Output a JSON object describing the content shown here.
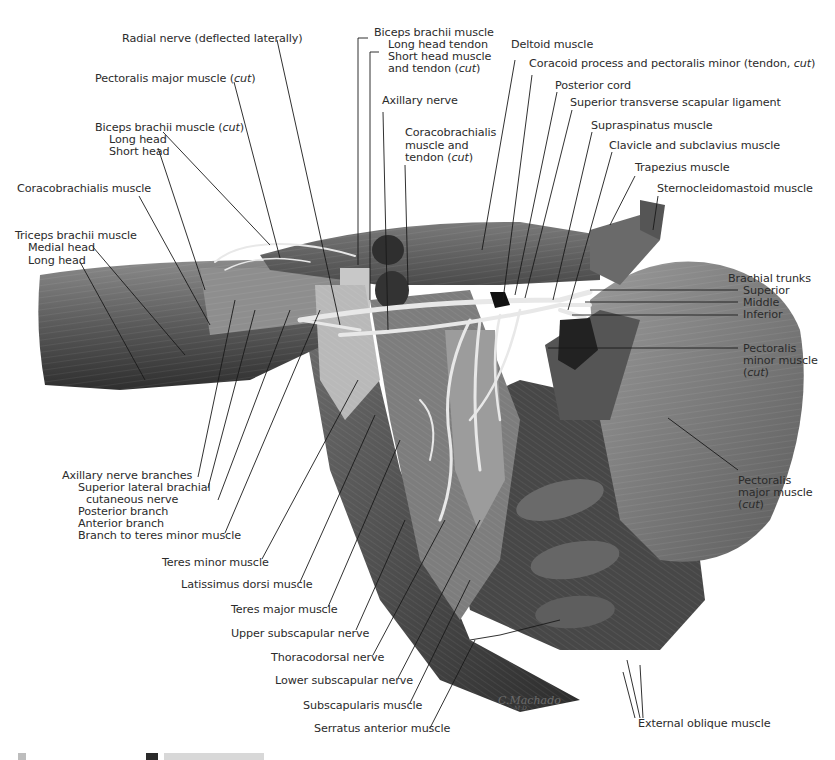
{
  "figure": {
    "type": "anatomical illustration",
    "artist_signature": "C.Machado",
    "signature_sub": "M.D."
  },
  "labels_left": {
    "radial_nerve": "Radial nerve (deflected laterally)",
    "pectoralis_major_cut": "Pectoralis major muscle",
    "pectoralis_major_cut_suffix": "cut",
    "biceps_cut_title": "Biceps brachii muscle",
    "biceps_cut_suffix": "cut",
    "biceps_long_head": "Long head",
    "biceps_short_head": "Short head",
    "coracobrachialis": "Coracobrachialis muscle",
    "triceps_title": "Triceps brachii muscle",
    "triceps_medial_head": "Medial head",
    "triceps_long_head": "Long head",
    "axillary_branches_title": "Axillary nerve branches",
    "superior_lateral_brachial_1": "Superior lateral brachial",
    "superior_lateral_brachial_2": "cutaneous nerve",
    "posterior_branch": "Posterior branch",
    "anterior_branch": "Anterior branch",
    "branch_teres_minor": "Branch to teres minor muscle",
    "teres_minor": "Teres minor muscle",
    "latissimus_dorsi": "Latissimus dorsi muscle",
    "teres_major": "Teres major muscle",
    "upper_subscapular": "Upper subscapular nerve",
    "thoracodorsal": "Thoracodorsal nerve",
    "lower_subscapular": "Lower subscapular nerve",
    "subscapularis": "Subscapularis muscle",
    "serratus_anterior": "Serratus anterior muscle"
  },
  "labels_top": {
    "biceps_title": "Biceps brachii muscle",
    "long_head_tendon": "Long head tendon",
    "short_head_1": "Short head muscle",
    "short_head_2": "and tendon (",
    "short_head_cut": "cut",
    "axillary_nerve": "Axillary nerve",
    "coracobrachialis_1": "Coracobrachialis",
    "coracobrachialis_2": "muscle and",
    "coracobrachialis_3": "tendon (",
    "coracobrachialis_cut": "cut",
    "deltoid": "Deltoid muscle",
    "coracoid": "Coracoid process and pectoralis minor (tendon, ",
    "coracoid_cut": "cut",
    "posterior_cord": "Posterior cord",
    "superior_transverse": "Superior transverse scapular ligament",
    "supraspinatus": "Supraspinatus muscle",
    "clavicle": "Clavicle and subclavius muscle",
    "trapezius": "Trapezius muscle",
    "sternocleidomastoid": "Sternocleidomastoid muscle"
  },
  "labels_right": {
    "brachial_trunks": "Brachial trunks",
    "superior": "Superior",
    "middle": "Middle",
    "inferior": "Inferior",
    "pec_minor_1": "Pectoralis",
    "pec_minor_2": "minor muscle",
    "pec_minor_cut": "cut",
    "pec_major_1": "Pectoralis",
    "pec_major_2": "major muscle",
    "pec_major_cut": "cut",
    "external_oblique": "External oblique muscle"
  },
  "colors": {
    "background": "#ffffff",
    "label_text": "#2b2b2b",
    "leader_line": "#1a1a1a",
    "muscle_dark": "#3a3a3a",
    "muscle_mid": "#6b6b6b",
    "muscle_light": "#a8a8a8",
    "nerve": "#e6e6e6"
  }
}
